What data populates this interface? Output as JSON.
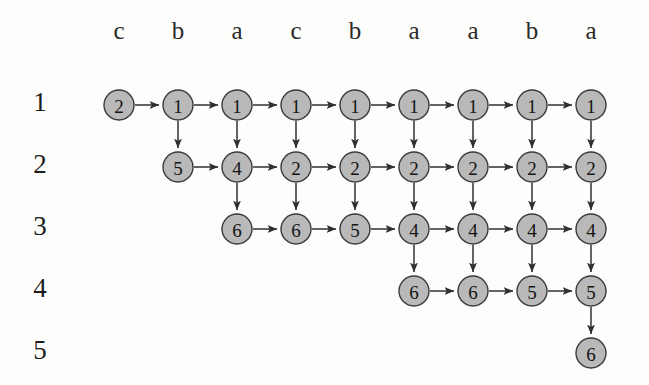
{
  "figure": {
    "type": "lattice-alignment-graph",
    "background_color": "#fdfdfc",
    "node_fill_color": "#b9b9b9",
    "node_stroke_color": "#3a3a3a",
    "edge_color": "#303030"
  },
  "columns": {
    "count": 9,
    "headers": [
      "c",
      "b",
      "a",
      "c",
      "b",
      "a",
      "a",
      "b",
      "a"
    ],
    "x_centers": [
      119,
      178,
      237,
      296,
      355,
      414,
      473,
      532,
      591
    ]
  },
  "rows": {
    "count": 5,
    "labels": [
      "1",
      "2",
      "3",
      "4",
      "5"
    ],
    "label_x": 40,
    "y_centers": [
      105,
      167,
      229,
      291,
      353
    ]
  },
  "nodes": [
    {
      "row": 1,
      "col": 1,
      "value": "2"
    },
    {
      "row": 1,
      "col": 2,
      "value": "1"
    },
    {
      "row": 1,
      "col": 3,
      "value": "1"
    },
    {
      "row": 1,
      "col": 4,
      "value": "1"
    },
    {
      "row": 1,
      "col": 5,
      "value": "1"
    },
    {
      "row": 1,
      "col": 6,
      "value": "1"
    },
    {
      "row": 1,
      "col": 7,
      "value": "1"
    },
    {
      "row": 1,
      "col": 8,
      "value": "1"
    },
    {
      "row": 1,
      "col": 9,
      "value": "1"
    },
    {
      "row": 2,
      "col": 2,
      "value": "5"
    },
    {
      "row": 2,
      "col": 3,
      "value": "4"
    },
    {
      "row": 2,
      "col": 4,
      "value": "2"
    },
    {
      "row": 2,
      "col": 5,
      "value": "2"
    },
    {
      "row": 2,
      "col": 6,
      "value": "2"
    },
    {
      "row": 2,
      "col": 7,
      "value": "2"
    },
    {
      "row": 2,
      "col": 8,
      "value": "2"
    },
    {
      "row": 2,
      "col": 9,
      "value": "2"
    },
    {
      "row": 3,
      "col": 3,
      "value": "6"
    },
    {
      "row": 3,
      "col": 4,
      "value": "6"
    },
    {
      "row": 3,
      "col": 5,
      "value": "5"
    },
    {
      "row": 3,
      "col": 6,
      "value": "4"
    },
    {
      "row": 3,
      "col": 7,
      "value": "4"
    },
    {
      "row": 3,
      "col": 8,
      "value": "4"
    },
    {
      "row": 3,
      "col": 9,
      "value": "4"
    },
    {
      "row": 4,
      "col": 6,
      "value": "6"
    },
    {
      "row": 4,
      "col": 7,
      "value": "6"
    },
    {
      "row": 4,
      "col": 8,
      "value": "5"
    },
    {
      "row": 4,
      "col": 9,
      "value": "5"
    },
    {
      "row": 5,
      "col": 9,
      "value": "6"
    }
  ],
  "edges": [
    {
      "from": [
        1,
        1
      ],
      "to": [
        1,
        2
      ],
      "dir": "right"
    },
    {
      "from": [
        1,
        2
      ],
      "to": [
        1,
        3
      ],
      "dir": "right"
    },
    {
      "from": [
        1,
        3
      ],
      "to": [
        1,
        4
      ],
      "dir": "right"
    },
    {
      "from": [
        1,
        4
      ],
      "to": [
        1,
        5
      ],
      "dir": "right"
    },
    {
      "from": [
        1,
        5
      ],
      "to": [
        1,
        6
      ],
      "dir": "right"
    },
    {
      "from": [
        1,
        6
      ],
      "to": [
        1,
        7
      ],
      "dir": "right"
    },
    {
      "from": [
        1,
        7
      ],
      "to": [
        1,
        8
      ],
      "dir": "right"
    },
    {
      "from": [
        1,
        8
      ],
      "to": [
        1,
        9
      ],
      "dir": "right"
    },
    {
      "from": [
        2,
        2
      ],
      "to": [
        2,
        3
      ],
      "dir": "right"
    },
    {
      "from": [
        2,
        3
      ],
      "to": [
        2,
        4
      ],
      "dir": "right"
    },
    {
      "from": [
        2,
        4
      ],
      "to": [
        2,
        5
      ],
      "dir": "right"
    },
    {
      "from": [
        2,
        5
      ],
      "to": [
        2,
        6
      ],
      "dir": "right"
    },
    {
      "from": [
        2,
        6
      ],
      "to": [
        2,
        7
      ],
      "dir": "right"
    },
    {
      "from": [
        2,
        7
      ],
      "to": [
        2,
        8
      ],
      "dir": "right"
    },
    {
      "from": [
        2,
        8
      ],
      "to": [
        2,
        9
      ],
      "dir": "right"
    },
    {
      "from": [
        3,
        3
      ],
      "to": [
        3,
        4
      ],
      "dir": "right"
    },
    {
      "from": [
        3,
        4
      ],
      "to": [
        3,
        5
      ],
      "dir": "right"
    },
    {
      "from": [
        3,
        5
      ],
      "to": [
        3,
        6
      ],
      "dir": "right"
    },
    {
      "from": [
        3,
        6
      ],
      "to": [
        3,
        7
      ],
      "dir": "right"
    },
    {
      "from": [
        3,
        7
      ],
      "to": [
        3,
        8
      ],
      "dir": "right"
    },
    {
      "from": [
        3,
        8
      ],
      "to": [
        3,
        9
      ],
      "dir": "right"
    },
    {
      "from": [
        4,
        6
      ],
      "to": [
        4,
        7
      ],
      "dir": "right"
    },
    {
      "from": [
        4,
        7
      ],
      "to": [
        4,
        8
      ],
      "dir": "right"
    },
    {
      "from": [
        4,
        8
      ],
      "to": [
        4,
        9
      ],
      "dir": "right"
    },
    {
      "from": [
        1,
        2
      ],
      "to": [
        2,
        2
      ],
      "dir": "down"
    },
    {
      "from": [
        1,
        3
      ],
      "to": [
        2,
        3
      ],
      "dir": "down"
    },
    {
      "from": [
        1,
        4
      ],
      "to": [
        2,
        4
      ],
      "dir": "down"
    },
    {
      "from": [
        1,
        5
      ],
      "to": [
        2,
        5
      ],
      "dir": "down"
    },
    {
      "from": [
        1,
        6
      ],
      "to": [
        2,
        6
      ],
      "dir": "down"
    },
    {
      "from": [
        1,
        7
      ],
      "to": [
        2,
        7
      ],
      "dir": "down"
    },
    {
      "from": [
        1,
        8
      ],
      "to": [
        2,
        8
      ],
      "dir": "down"
    },
    {
      "from": [
        1,
        9
      ],
      "to": [
        2,
        9
      ],
      "dir": "down"
    },
    {
      "from": [
        2,
        3
      ],
      "to": [
        3,
        3
      ],
      "dir": "down"
    },
    {
      "from": [
        2,
        4
      ],
      "to": [
        3,
        4
      ],
      "dir": "down"
    },
    {
      "from": [
        2,
        5
      ],
      "to": [
        3,
        5
      ],
      "dir": "down"
    },
    {
      "from": [
        2,
        6
      ],
      "to": [
        3,
        6
      ],
      "dir": "down"
    },
    {
      "from": [
        2,
        7
      ],
      "to": [
        3,
        7
      ],
      "dir": "down"
    },
    {
      "from": [
        2,
        8
      ],
      "to": [
        3,
        8
      ],
      "dir": "down"
    },
    {
      "from": [
        2,
        9
      ],
      "to": [
        3,
        9
      ],
      "dir": "down"
    },
    {
      "from": [
        3,
        6
      ],
      "to": [
        4,
        6
      ],
      "dir": "down"
    },
    {
      "from": [
        3,
        7
      ],
      "to": [
        4,
        7
      ],
      "dir": "down"
    },
    {
      "from": [
        3,
        8
      ],
      "to": [
        4,
        8
      ],
      "dir": "down"
    },
    {
      "from": [
        3,
        9
      ],
      "to": [
        4,
        9
      ],
      "dir": "down"
    },
    {
      "from": [
        4,
        9
      ],
      "to": [
        5,
        9
      ],
      "dir": "down"
    }
  ],
  "node_radius": 15,
  "header_y": 33
}
